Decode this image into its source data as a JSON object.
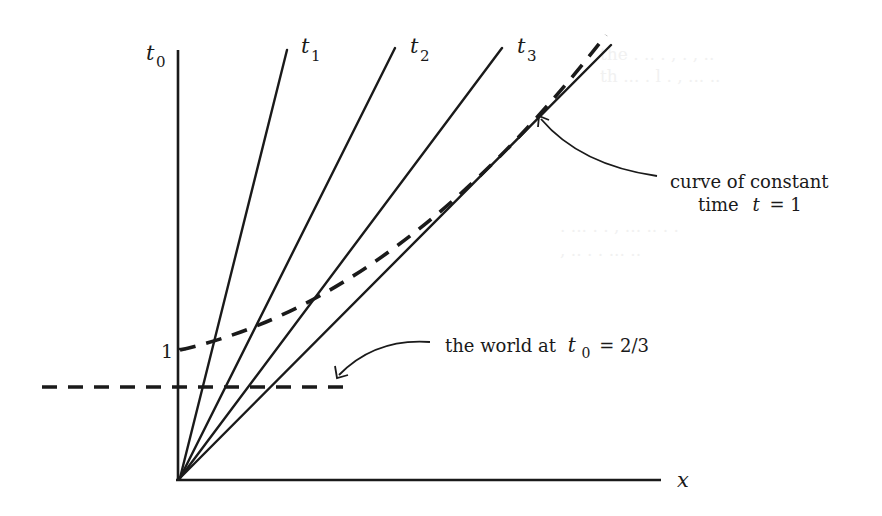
{
  "figure": {
    "axes": {
      "y_axis_label": "t",
      "y_axis_subscript": "0",
      "x_axis_label": "x",
      "tick_label_1": "1"
    },
    "worldlines": [
      {
        "label": "t",
        "subscript": "1"
      },
      {
        "label": "t",
        "subscript": "2"
      },
      {
        "label": "t",
        "subscript": "3"
      }
    ],
    "annotations": {
      "constant_time_line1": "curve of constant",
      "constant_time_line2_prefix": "time",
      "constant_time_var": "t",
      "constant_time_eq": "= 1",
      "world_prefix": "the world at",
      "world_var": "t",
      "world_subscript": "0",
      "world_eq": "= 2/3"
    },
    "colors": {
      "ink": "#1a1a1a",
      "background": "#ffffff"
    }
  }
}
